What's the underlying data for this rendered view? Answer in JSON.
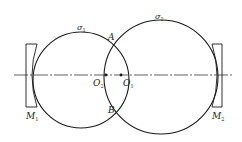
{
  "diagram": {
    "type": "optical-resonator-schematic",
    "stroke_color": "#1a1a1a",
    "background": "#ffffff",
    "axis": {
      "x1": 14,
      "x2": 232,
      "y": 75,
      "style": "dash-dot"
    },
    "circles": [
      {
        "id": "sigma1",
        "label": "σ",
        "sub": "1",
        "cx": 81,
        "cy": 80,
        "r": 48,
        "label_x": 77,
        "label_y": 30
      },
      {
        "id": "sigma2",
        "label": "σ",
        "sub": "2",
        "cx": 161,
        "cy": 77,
        "r": 57,
        "label_x": 155,
        "label_y": 19
      }
    ],
    "points": [
      {
        "id": "A",
        "label": "A",
        "x": 113,
        "y": 52,
        "label_x": 108,
        "label_y": 40,
        "dot": false
      },
      {
        "id": "B",
        "label": "B",
        "x": 113,
        "y": 98,
        "label_x": 108,
        "label_y": 113,
        "dot": false
      },
      {
        "id": "O2",
        "label": "O",
        "sub": "2",
        "x": 106,
        "y": 75,
        "label_x": 93,
        "label_y": 86,
        "dot": true
      },
      {
        "id": "O1",
        "label": "O",
        "sub": "1",
        "x": 121,
        "y": 75,
        "label_x": 123,
        "label_y": 86,
        "dot": true
      }
    ],
    "mirrors": [
      {
        "id": "M1",
        "label": "M",
        "sub": "1",
        "x": 26,
        "y": 44,
        "w": 11,
        "h": 63,
        "concave_side": "right",
        "label_x": 26,
        "label_y": 119
      },
      {
        "id": "M2",
        "label": "M",
        "sub": "2",
        "x": 212,
        "y": 44,
        "w": 10,
        "h": 63,
        "concave_side": "left",
        "label_x": 212,
        "label_y": 119
      }
    ]
  }
}
